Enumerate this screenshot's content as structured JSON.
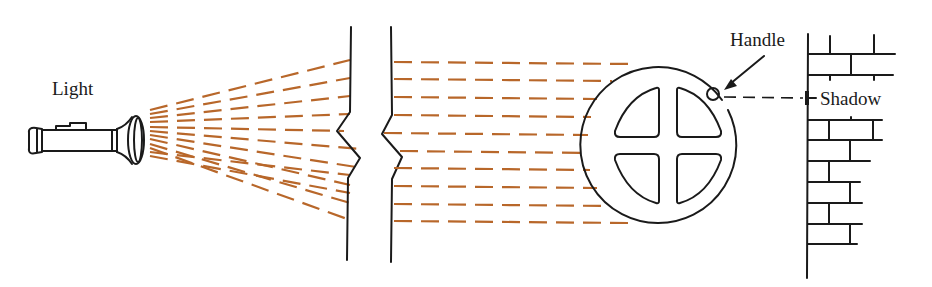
{
  "diagram": {
    "labels": {
      "light": "Light",
      "handle": "Handle",
      "shadow": "Shadow"
    },
    "colors": {
      "ink": "#1a1a1a",
      "beam": "#b8672a",
      "background": "#ffffff"
    },
    "components": [
      {
        "id": "flashlight",
        "description": "flashlight emitting light"
      },
      {
        "id": "diverging-beams",
        "description": "light rays fanning out from flashlight",
        "count": 14
      },
      {
        "id": "broken-barrier",
        "description": "two vertical lines with zig-zag break symbol"
      },
      {
        "id": "parallel-beams",
        "description": "parallel light rays",
        "count": 10
      },
      {
        "id": "wheel",
        "description": "circular wheel with four quadrant cut-outs"
      },
      {
        "id": "handle",
        "description": "small circle on rim of wheel"
      },
      {
        "id": "shadow-projection",
        "description": "dashed line from handle to shadow on wall"
      },
      {
        "id": "brick-wall",
        "description": "brick wall receiving the shadow"
      }
    ]
  }
}
